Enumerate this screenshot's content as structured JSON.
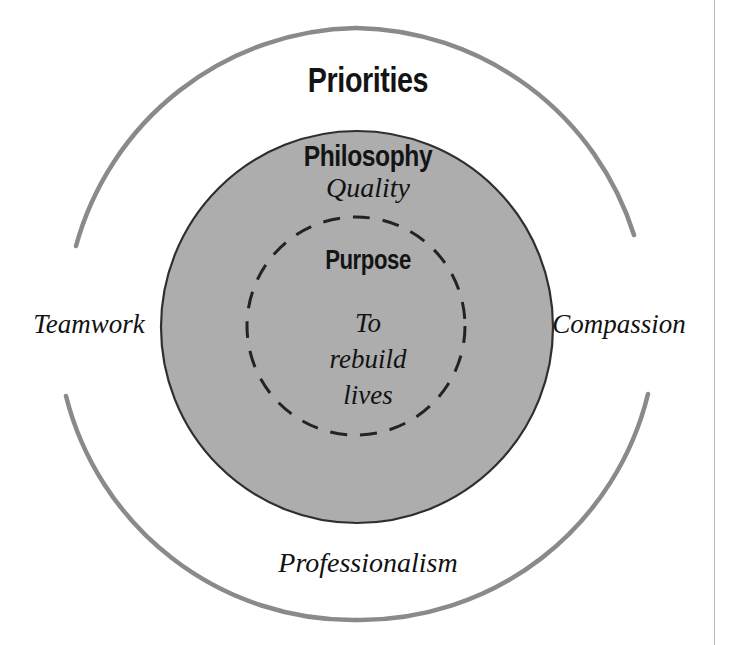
{
  "diagram": {
    "type": "concentric-circles",
    "background_color": "#ffffff",
    "rings": [
      {
        "name": "outer-ring",
        "heading": "Priorities",
        "stroke_color": "#8a8a8a",
        "fill_color": "#ffffff",
        "stroke_style": "solid",
        "values": [
          "Teamwork",
          "Compassion",
          "Professionalism"
        ]
      },
      {
        "name": "middle-ring",
        "heading": "Philosophy",
        "stroke_color": "#2b2b2b",
        "fill_color": "#adadad",
        "stroke_style": "solid",
        "values": [
          "Quality"
        ]
      },
      {
        "name": "inner-ring",
        "heading": "Purpose",
        "stroke_color": "#262626",
        "fill_color": "transparent",
        "stroke_style": "dashed",
        "values": [
          "To rebuild lives"
        ]
      }
    ],
    "labels": {
      "priorities": "Priorities",
      "philosophy": "Philosophy",
      "quality": "Quality",
      "purpose": "Purpose",
      "mission_line_1": "To",
      "mission_line_2": "rebuild",
      "mission_line_3": "lives",
      "teamwork": "Teamwork",
      "compassion": "Compassion",
      "professionalism": "Professionalism"
    }
  }
}
